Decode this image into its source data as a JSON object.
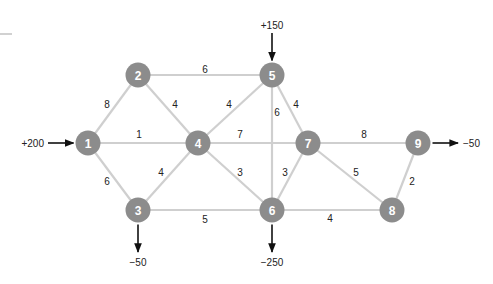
{
  "diagram": {
    "type": "network-flow-graph",
    "nodes": [
      {
        "id": "1",
        "label": "1",
        "x": 88,
        "y": 143
      },
      {
        "id": "2",
        "label": "2",
        "x": 138,
        "y": 75
      },
      {
        "id": "3",
        "label": "3",
        "x": 138,
        "y": 210
      },
      {
        "id": "4",
        "label": "4",
        "x": 198,
        "y": 143
      },
      {
        "id": "5",
        "label": "5",
        "x": 272,
        "y": 75
      },
      {
        "id": "6",
        "label": "6",
        "x": 272,
        "y": 210
      },
      {
        "id": "7",
        "label": "7",
        "x": 308,
        "y": 143
      },
      {
        "id": "8",
        "label": "8",
        "x": 392,
        "y": 210
      },
      {
        "id": "9",
        "label": "9",
        "x": 418,
        "y": 143
      }
    ],
    "edges": [
      {
        "from": "1",
        "to": "2",
        "weight": "8",
        "lx": 107,
        "ly": 104
      },
      {
        "from": "1",
        "to": "4",
        "weight": "1",
        "lx": 139,
        "ly": 134
      },
      {
        "from": "1",
        "to": "3",
        "weight": "6",
        "lx": 107,
        "ly": 181
      },
      {
        "from": "2",
        "to": "5",
        "weight": "6",
        "lx": 205,
        "ly": 69
      },
      {
        "from": "2",
        "to": "4",
        "weight": "4",
        "lx": 175,
        "ly": 104
      },
      {
        "from": "3",
        "to": "4",
        "weight": "4",
        "lx": 161,
        "ly": 172
      },
      {
        "from": "3",
        "to": "6",
        "weight": "5",
        "lx": 205,
        "ly": 219
      },
      {
        "from": "4",
        "to": "5",
        "weight": "4",
        "lx": 229,
        "ly": 104
      },
      {
        "from": "4",
        "to": "7",
        "weight": "7",
        "lx": 240,
        "ly": 134
      },
      {
        "from": "4",
        "to": "6",
        "weight": "3",
        "lx": 240,
        "ly": 172
      },
      {
        "from": "5",
        "to": "6",
        "weight": "6",
        "lx": 277,
        "ly": 112
      },
      {
        "from": "5",
        "to": "7",
        "weight": "4",
        "lx": 296,
        "ly": 104
      },
      {
        "from": "6",
        "to": "7",
        "weight": "3",
        "lx": 285,
        "ly": 172
      },
      {
        "from": "6",
        "to": "8",
        "weight": "4",
        "lx": 330,
        "ly": 218
      },
      {
        "from": "7",
        "to": "9",
        "weight": "8",
        "lx": 364,
        "ly": 134
      },
      {
        "from": "7",
        "to": "8",
        "weight": "5",
        "lx": 356,
        "ly": 172
      },
      {
        "from": "8",
        "to": "9",
        "weight": "2",
        "lx": 412,
        "ly": 181
      }
    ],
    "flows": [
      {
        "node": "1",
        "value": "+200",
        "direction": "in",
        "side": "left"
      },
      {
        "node": "5",
        "value": "+150",
        "direction": "in",
        "side": "top"
      },
      {
        "node": "3",
        "value": "−50",
        "direction": "out",
        "side": "bottom"
      },
      {
        "node": "6",
        "value": "−250",
        "direction": "out",
        "side": "bottom"
      },
      {
        "node": "9",
        "value": "−50",
        "direction": "out",
        "side": "right"
      }
    ],
    "colors": {
      "node_fill": "#8c8c8c",
      "node_text": "#ffffff",
      "edge": "#cfcfcf",
      "arrow": "#111111",
      "text": "#222222"
    }
  }
}
